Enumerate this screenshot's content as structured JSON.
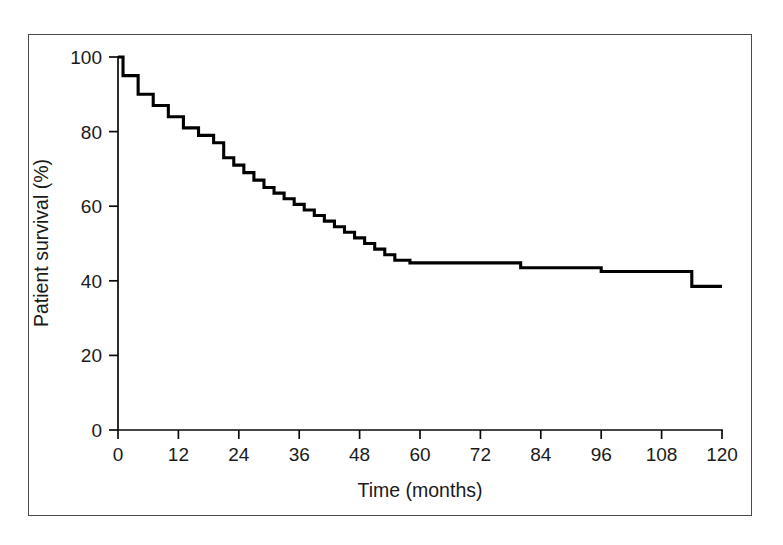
{
  "figure": {
    "frame_present": true,
    "background_color": "#ffffff",
    "frame_color": "#4a4a4a"
  },
  "chart_data": {
    "type": "line",
    "subtype": "kaplan-meier-step",
    "title": "",
    "xlabel": "Time (months)",
    "ylabel": "Patient survival (%)",
    "xlim": [
      0,
      120
    ],
    "ylim": [
      0,
      100
    ],
    "xticks": [
      0,
      12,
      24,
      36,
      48,
      60,
      72,
      84,
      96,
      108,
      120
    ],
    "xtick_labels": [
      "0",
      "12",
      "24",
      "36",
      "48",
      "60",
      "72",
      "84",
      "96",
      "108",
      "120"
    ],
    "yticks": [
      0,
      20,
      40,
      60,
      80,
      100
    ],
    "ytick_labels": [
      "0",
      "20",
      "40",
      "60",
      "80",
      "100"
    ],
    "grid": false,
    "legend": false,
    "legend_position": "none",
    "line_color": "#000000",
    "line_width": 3.1,
    "censoring_marks": false,
    "series": [
      {
        "name": "Patient survival",
        "x": [
          0,
          1,
          1,
          4,
          4,
          7,
          7,
          10,
          10,
          13,
          13,
          16,
          16,
          19,
          19,
          21,
          21,
          23,
          23,
          25,
          25,
          27,
          27,
          29,
          29,
          31,
          31,
          33,
          33,
          35,
          35,
          37,
          37,
          39,
          39,
          41,
          41,
          43,
          43,
          45,
          45,
          47,
          47,
          49,
          49,
          51,
          51,
          53,
          53,
          55,
          55,
          58,
          58,
          80,
          80,
          96,
          96,
          114,
          114,
          120
        ],
        "y": [
          100,
          100,
          95,
          95,
          90,
          90,
          87,
          87,
          84,
          84,
          81,
          81,
          79,
          79,
          77,
          77,
          73,
          73,
          71,
          71,
          69,
          69,
          67,
          67,
          65,
          65,
          63.5,
          63.5,
          62,
          62,
          60.5,
          60.5,
          59,
          59,
          57.5,
          57.5,
          56,
          56,
          54.5,
          54.5,
          53,
          53,
          51.5,
          51.5,
          50,
          50,
          48.5,
          48.5,
          47,
          47,
          45.5,
          45.5,
          44.8,
          44.8,
          43.5,
          43.5,
          42.5,
          42.5,
          38.5,
          38.5
        ]
      }
    ]
  }
}
